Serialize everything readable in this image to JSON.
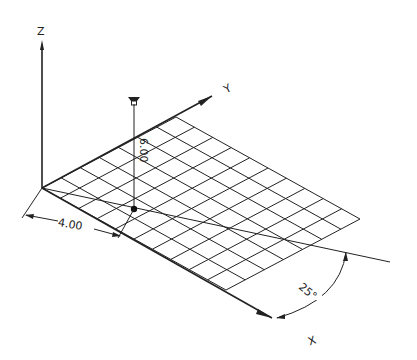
{
  "diagram": {
    "type": "3d-isometric-viewpoint-drawing",
    "colors": {
      "line": "#222222",
      "background": "#ffffff"
    },
    "axes": {
      "z_label": "Z",
      "y_label": "Y",
      "x_label": "X"
    },
    "grid": {
      "cells_x": 10,
      "cells_y": 7
    },
    "dimensions": {
      "horizontal_distance": "4.00",
      "height": "6.00",
      "angle": "25°"
    },
    "markers": {
      "viewpoint": "viewer-eye-marker",
      "ground_point": "projection-dot"
    }
  }
}
